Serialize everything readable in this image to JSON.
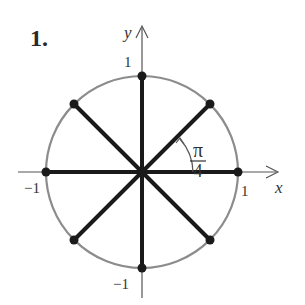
{
  "problem": {
    "number_label": "1."
  },
  "axes": {
    "x_label": "x",
    "y_label": "y",
    "tick_labels": {
      "x_pos": "1",
      "x_neg": "−1",
      "y_pos": "1",
      "y_neg": "−1"
    }
  },
  "angle_annotation": {
    "numerator": "π",
    "denominator": "4"
  },
  "colors": {
    "circle": "#8c8c8c",
    "spokes": "#1a1a1a",
    "axes": "#555555",
    "points": "#1a1a1a"
  },
  "diagram": {
    "type": "unit-circle",
    "center_px": [
      142,
      172
    ],
    "radius_px": 96,
    "spoke_angles_deg": [
      0,
      45,
      90,
      135,
      180,
      225,
      270,
      315
    ],
    "points": [
      {
        "angle": "0",
        "coords": [
          1,
          0
        ]
      },
      {
        "angle": "π/4",
        "coords": [
          0.707,
          0.707
        ]
      },
      {
        "angle": "π/2",
        "coords": [
          0,
          1
        ]
      },
      {
        "angle": "3π/4",
        "coords": [
          -0.707,
          0.707
        ]
      },
      {
        "angle": "π",
        "coords": [
          -1,
          0
        ]
      },
      {
        "angle": "5π/4",
        "coords": [
          -0.707,
          -0.707
        ]
      },
      {
        "angle": "3π/2",
        "coords": [
          0,
          -1
        ]
      },
      {
        "angle": "7π/4",
        "coords": [
          0.707,
          -0.707
        ]
      }
    ]
  }
}
